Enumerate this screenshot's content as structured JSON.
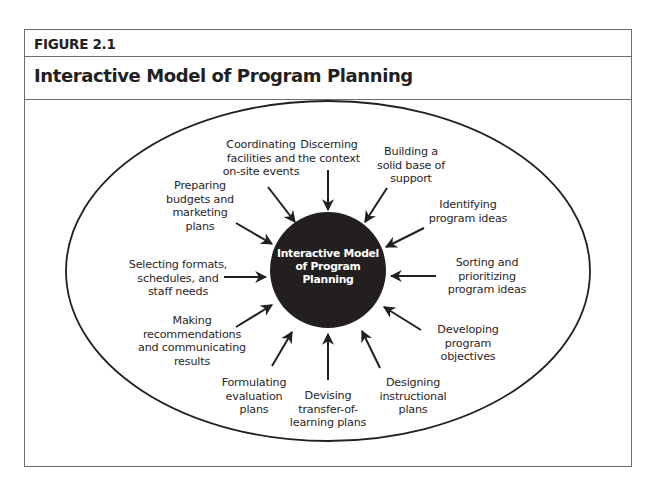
{
  "figure": {
    "label": "FIGURE 2.1",
    "title": "Interactive Model of Program Planning"
  },
  "diagram": {
    "center": "Interactive Model\nof Program\nPlanning",
    "components": [
      {
        "id": "discerning",
        "label": "Discerning\nthe context"
      },
      {
        "id": "building",
        "label": "Building a\nsolid base of\nsupport"
      },
      {
        "id": "identifying",
        "label": "Identifying\nprogram ideas"
      },
      {
        "id": "sorting",
        "label": "Sorting and\nprioritizing\nprogram ideas"
      },
      {
        "id": "developing",
        "label": "Developing\nprogram\nobjectives"
      },
      {
        "id": "designing",
        "label": "Designing\ninstructional\nplans"
      },
      {
        "id": "devising",
        "label": "Devising\ntransfer-of-\nlearning plans"
      },
      {
        "id": "formulating",
        "label": "Formulating\nevaluation\nplans"
      },
      {
        "id": "making",
        "label": "Making\nrecommendations\nand communicating\nresults"
      },
      {
        "id": "selecting",
        "label": "Selecting formats,\nschedules, and\nstaff needs"
      },
      {
        "id": "preparing",
        "label": "Preparing\nbudgets and\nmarketing\nplans"
      },
      {
        "id": "coordinating",
        "label": "Coordinating\nfacilities and\non-site events"
      }
    ],
    "colors": {
      "center_fill": "#231f20",
      "center_text": "#ffffff",
      "line": "#231f20",
      "frame": "#6d6d6d"
    }
  }
}
